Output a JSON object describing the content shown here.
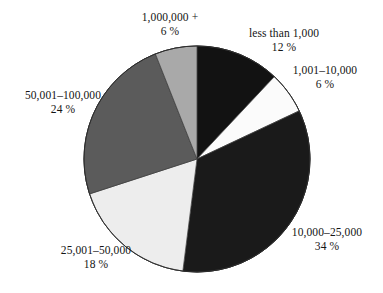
{
  "figure": {
    "type": "pie-chart",
    "background_color": "#ffffff",
    "text_color": "#151515"
  },
  "chart_data": {
    "type": "pie",
    "title": "",
    "subtitle": "",
    "xlabel": "",
    "ylabel": "",
    "legend_position": "none",
    "grid": false,
    "labels_outside": true,
    "start_angle_deg": 0,
    "direction": "clockwise",
    "center": {
      "x": 197,
      "y": 159
    },
    "radius": 113,
    "categories": [
      "less than 1,000",
      "1,001–10,000",
      "10,000–25,000",
      "25,001–50,000",
      "50,001–100,000",
      "1,000,000 +"
    ],
    "values": [
      12,
      6,
      34,
      18,
      24,
      6
    ],
    "value_unit": "%",
    "total": 100,
    "colors": [
      "#121212",
      "#fbfbfb",
      "#1a1a1a",
      "#ededed",
      "#5b5b5b",
      "#a9a9a9"
    ],
    "slices": [
      {
        "label": "less than 1,000",
        "percent_text": "12 %",
        "value": 12,
        "color": "#121212",
        "start_deg": 0,
        "end_deg": 43.2
      },
      {
        "label": "1,001–10,000",
        "percent_text": "6 %",
        "value": 6,
        "color": "#fbfbfb",
        "start_deg": 43.2,
        "end_deg": 64.8
      },
      {
        "label": "10,000–25,000",
        "percent_text": "34 %",
        "value": 34,
        "color": "#1a1a1a",
        "start_deg": 64.8,
        "end_deg": 187.2
      },
      {
        "label": "25,001–50,000",
        "percent_text": "18 %",
        "value": 18,
        "color": "#ededed",
        "start_deg": 187.2,
        "end_deg": 252.0
      },
      {
        "label": "50,001–100,000",
        "percent_text": "24 %",
        "value": 24,
        "color": "#5b5b5b",
        "start_deg": 252.0,
        "end_deg": 338.4
      },
      {
        "label": "1,000,000 +",
        "percent_text": "6 %",
        "value": 6,
        "color": "#a9a9a9",
        "start_deg": 338.4,
        "end_deg": 360.0
      }
    ]
  },
  "labels": {
    "less_than_1000": {
      "name": "less than 1,000",
      "percent": "12 %"
    },
    "r1001_10000": {
      "name": "1,001–10,000",
      "percent": "6 %"
    },
    "r10000_25000": {
      "name": "10,000–25,000",
      "percent": "34 %"
    },
    "r25001_50000": {
      "name": "25,001–50,000",
      "percent": "18 %"
    },
    "r50001_100000": {
      "name": "50,001–100,000",
      "percent": "24 %"
    },
    "r1000000plus": {
      "name": "1,000,000 +",
      "percent": "6 %"
    }
  }
}
